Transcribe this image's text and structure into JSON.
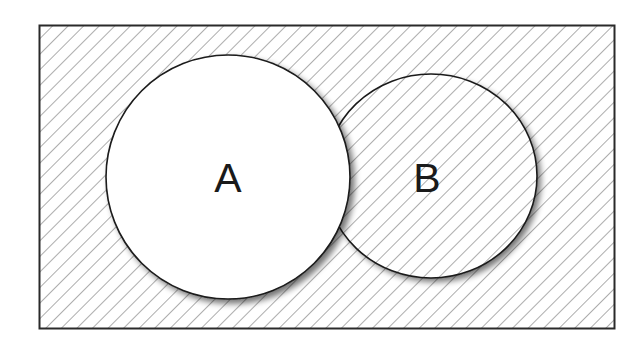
{
  "diagram": {
    "type": "venn",
    "universe": {
      "x": 39,
      "y": 25,
      "width": 575,
      "height": 303,
      "shaded": true
    },
    "sets": [
      {
        "id": "A",
        "label": "A",
        "shape": "circle",
        "cx": 228,
        "cy": 177,
        "r": 122,
        "shaded": false
      },
      {
        "id": "B",
        "label": "B",
        "shape": "ellipse",
        "cx": 431,
        "cy": 176,
        "rx": 106,
        "ry": 102,
        "shaded": true
      }
    ],
    "shaded_region": "complement of A (A')",
    "hatch": {
      "spacing": 11,
      "angle": 45,
      "color": "#7a7a7a"
    },
    "stroke_color": "#1a1a1a"
  }
}
